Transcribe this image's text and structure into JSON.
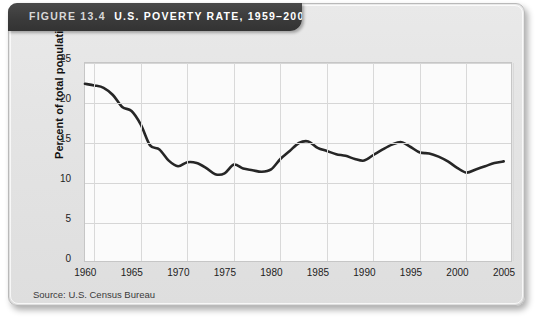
{
  "header": {
    "figure_number": "FIGURE 13.4",
    "title": "U.S. POVERTY RATE, 1959–2004",
    "full_title": "FIGURE 13.4   U.S. POVERTY RATE, 1959–2004"
  },
  "source_note": "Source: U.S. Census Bureau",
  "colors": {
    "titlebar": "#3b3b3b",
    "card": "#e4e4e4",
    "plot_background": "#fbfbfb",
    "gridline": "#d6d6d6",
    "line": "#262626"
  },
  "chart_data": {
    "type": "line",
    "title": "U.S. POVERTY RATE, 1959–2004",
    "xlabel": "",
    "ylabel": "Percent of total population",
    "xlim": [
      1959,
      2005
    ],
    "ylim": [
      0,
      25
    ],
    "ytick_labels": [
      "0",
      "5",
      "10",
      "15",
      "20",
      "25"
    ],
    "ytick_values": [
      0,
      5,
      10,
      15,
      20,
      25
    ],
    "xtick_labels": [
      "1960",
      "1965",
      "1970",
      "1975",
      "1980",
      "1985",
      "1990",
      "1995",
      "2000",
      "2005"
    ],
    "xtick_values": [
      1960,
      1965,
      1970,
      1975,
      1980,
      1985,
      1990,
      1995,
      2000,
      2005
    ],
    "grid": true,
    "legend": "none",
    "series": [
      {
        "name": "Percent of total population in poverty",
        "x": [
          1959,
          1960,
          1961,
          1962,
          1963,
          1964,
          1965,
          1966,
          1967,
          1968,
          1969,
          1970,
          1971,
          1972,
          1973,
          1974,
          1975,
          1976,
          1977,
          1978,
          1979,
          1980,
          1981,
          1982,
          1983,
          1984,
          1985,
          1986,
          1987,
          1988,
          1989,
          1990,
          1991,
          1992,
          1993,
          1994,
          1995,
          1996,
          1997,
          1998,
          1999,
          2000,
          2001,
          2002,
          2003,
          2004
        ],
        "values": [
          22.4,
          22.2,
          21.9,
          21.0,
          19.5,
          19.0,
          17.3,
          14.7,
          14.2,
          12.8,
          12.1,
          12.6,
          12.5,
          11.9,
          11.1,
          11.2,
          12.3,
          11.8,
          11.6,
          11.4,
          11.7,
          13.0,
          14.0,
          15.0,
          15.2,
          14.4,
          14.0,
          13.6,
          13.4,
          13.0,
          12.8,
          13.5,
          14.2,
          14.8,
          15.1,
          14.5,
          13.8,
          13.7,
          13.3,
          12.7,
          11.9,
          11.3,
          11.7,
          12.1,
          12.5,
          12.7
        ]
      }
    ]
  }
}
